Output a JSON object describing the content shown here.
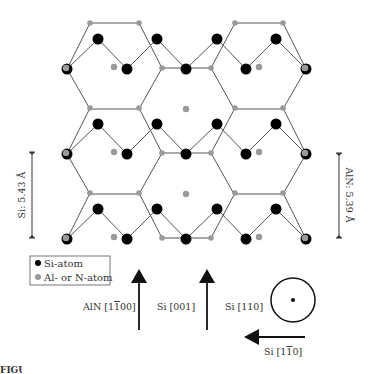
{
  "colors": {
    "si_atom": "#000000",
    "al_n_atom": "#9a9a9a",
    "bond": "#555555",
    "text": "#333333"
  },
  "legend": {
    "items": [
      {
        "label": "Si-atom",
        "color": "#000000"
      },
      {
        "label": "Al- or N-atom",
        "color": "#9a9a9a"
      }
    ]
  },
  "dimensions": {
    "left_label": "Si: 5.43 Å",
    "right_label": "AlN: 5.39 Å"
  },
  "directions": {
    "aln_label": "AlN [1̅0̅0]",
    "aln_text": "AlN [1",
    "aln_bar": "1",
    "aln_tail": "00]",
    "si001_label": "Si [001]",
    "si110_label": "Si [110]",
    "si1m10_text": "Si [1",
    "si1m10_bar": "1",
    "si1m10_tail": "0]"
  },
  "figure_label": "FIGURE 5.16"
}
